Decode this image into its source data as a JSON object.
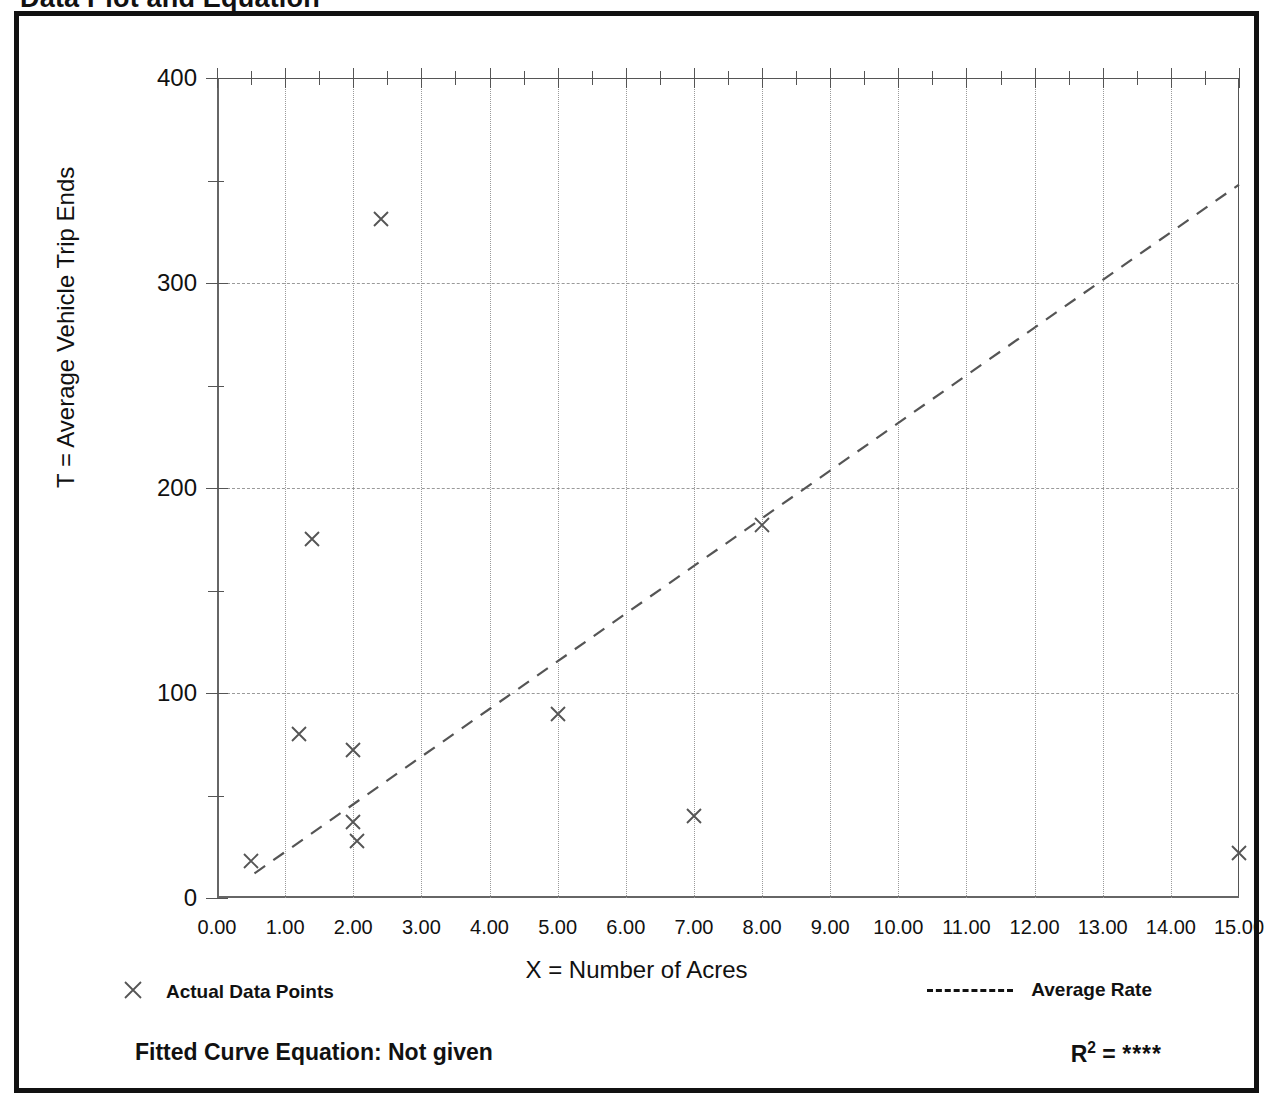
{
  "figure": {
    "title": "Data Plot and Equation"
  },
  "legend": {
    "data_points_label": "Actual Data Points",
    "data_points_marker": "x-cross-marker",
    "average_rate_label": "Average Rate",
    "average_rate_marker": "dashed-line"
  },
  "footer": {
    "equation_label": "Fitted Curve Equation:",
    "equation_value": "Not given",
    "equation_full": "Fitted Curve Equation:  Not given",
    "r_squared_label": "R",
    "r_squared_exponent": "2",
    "r_squared_equals": "=",
    "r_squared_value": "****"
  },
  "colors": {
    "frame": "#111111",
    "grid": "#9a9a9a",
    "axis": "#555555",
    "marker": "#555555",
    "trend": "#555555",
    "text": "#111111",
    "background": "#ffffff"
  },
  "chart_data": {
    "type": "scatter",
    "title": "Data Plot and Equation",
    "xlabel": "X = Number of Acres",
    "ylabel": "T = Average Vehicle Trip Ends",
    "xlim": [
      0,
      15
    ],
    "ylim": [
      0,
      400
    ],
    "xticks": [
      0,
      1,
      2,
      3,
      4,
      5,
      6,
      7,
      8,
      9,
      10,
      11,
      12,
      13,
      14,
      15
    ],
    "xticklabels": [
      "0.00",
      "1.00",
      "2.00",
      "3.00",
      "4.00",
      "5.00",
      "6.00",
      "7.00",
      "8.00",
      "9.00",
      "10.00",
      "11.00",
      "12.00",
      "13.00",
      "14.00",
      "15.00"
    ],
    "xminorticks": [
      0.5,
      1.5,
      2.5,
      3.5,
      4.5,
      5.5,
      6.5,
      7.5,
      8.5,
      9.5,
      10.5,
      11.5,
      12.5,
      13.5,
      14.5
    ],
    "yticks": [
      0,
      100,
      200,
      300,
      400
    ],
    "yticklabels": [
      "0",
      "100",
      "200",
      "300",
      "400"
    ],
    "yminorticks": [
      50,
      150,
      250,
      350
    ],
    "grid": true,
    "grid_x_values": [
      1,
      2,
      3,
      4,
      5,
      6,
      7,
      8,
      9,
      10,
      11,
      12,
      13,
      14
    ],
    "grid_y_values": [
      100,
      200,
      300
    ],
    "legend_position": "below-plot",
    "series": [
      {
        "name": "Actual Data Points",
        "type": "scatter",
        "marker": "x",
        "points": [
          {
            "x": 0.5,
            "y": 18
          },
          {
            "x": 1.2,
            "y": 80
          },
          {
            "x": 1.4,
            "y": 175
          },
          {
            "x": 2.0,
            "y": 72
          },
          {
            "x": 2.0,
            "y": 37
          },
          {
            "x": 2.05,
            "y": 28
          },
          {
            "x": 2.4,
            "y": 331
          },
          {
            "x": 5.0,
            "y": 90
          },
          {
            "x": 7.0,
            "y": 40
          },
          {
            "x": 8.0,
            "y": 182
          },
          {
            "x": 15.0,
            "y": 22
          }
        ]
      },
      {
        "name": "Average Rate",
        "type": "line",
        "style": "dashed",
        "points": [
          {
            "x": 0.55,
            "y": 12
          },
          {
            "x": 15.0,
            "y": 348
          }
        ]
      }
    ]
  }
}
